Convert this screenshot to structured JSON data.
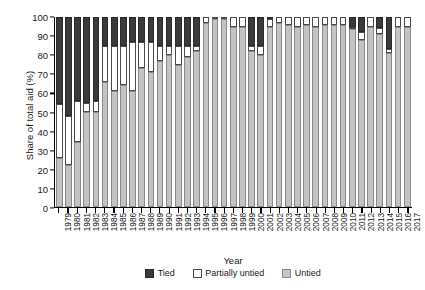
{
  "chart_data": {
    "type": "bar",
    "subtype": "stacked-vertical-100",
    "title": "",
    "xlabel": "Year",
    "ylabel": "Share of total aid (%)",
    "ylim": [
      0,
      100
    ],
    "yticks": [
      0,
      10,
      20,
      30,
      40,
      50,
      60,
      70,
      80,
      90,
      100
    ],
    "grid": false,
    "legend_position": "bottom",
    "categories": [
      "1979",
      "1980",
      "1981",
      "1982",
      "1983",
      "1984",
      "1985",
      "1986",
      "1987",
      "1988",
      "1989",
      "1990",
      "1991",
      "1992",
      "1993",
      "1994",
      "1995",
      "1996",
      "1997",
      "1998",
      "1999",
      "2000",
      "2001",
      "2002",
      "2003",
      "2004",
      "2005",
      "2006",
      "2007",
      "2008",
      "2009",
      "2010",
      "2011",
      "2012",
      "2013",
      "2014",
      "2015",
      "2016",
      "2017"
    ],
    "series": [
      {
        "name": "Untied",
        "color": "#c4c4c4",
        "values": [
          26,
          22,
          34,
          50,
          50,
          66,
          61,
          64,
          61,
          73,
          71,
          77,
          80,
          75,
          79,
          82,
          97,
          99,
          99,
          95,
          95,
          82,
          80,
          95,
          97,
          96,
          95,
          96,
          95,
          96,
          96,
          96,
          94,
          88,
          95,
          91,
          81,
          95,
          95
        ]
      },
      {
        "name": "Partially untied",
        "color": "#ffffff",
        "values": [
          28,
          26,
          22,
          5,
          6,
          19,
          24,
          21,
          26,
          14,
          16,
          8,
          5,
          10,
          6,
          3,
          3,
          1,
          1,
          5,
          5,
          3,
          5,
          4,
          3,
          4,
          5,
          4,
          5,
          4,
          4,
          4,
          1,
          4,
          5,
          3,
          2,
          5,
          5
        ]
      },
      {
        "name": "Tied",
        "color": "#3a3a3a",
        "values": [
          46,
          52,
          44,
          45,
          44,
          15,
          15,
          15,
          13,
          13,
          13,
          15,
          15,
          15,
          15,
          15,
          0,
          0,
          0,
          0,
          0,
          15,
          15,
          1,
          0,
          0,
          0,
          0,
          0,
          0,
          0,
          0,
          5,
          8,
          0,
          6,
          17,
          0,
          0
        ]
      }
    ],
    "stack_order_bottom_to_top": [
      "Untied",
      "Partially untied",
      "Tied"
    ]
  },
  "legend": {
    "items": [
      {
        "label": "Tied",
        "key": "tied"
      },
      {
        "label": "Partially untied",
        "key": "partial"
      },
      {
        "label": "Untied",
        "key": "untied"
      }
    ]
  }
}
